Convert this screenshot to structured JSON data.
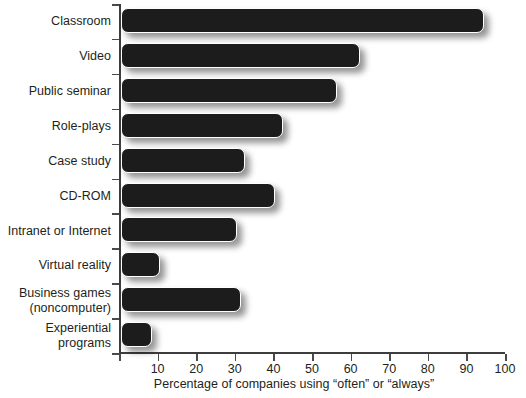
{
  "chart_data": {
    "type": "bar",
    "orientation": "horizontal",
    "title": "",
    "subtitle": "",
    "xlabel": "Percentage of companies using “often” or “always”",
    "ylabel": "",
    "xlim": [
      0,
      100
    ],
    "xticks": [
      0,
      10,
      20,
      30,
      40,
      50,
      60,
      70,
      80,
      90,
      100
    ],
    "xtick_labels": [
      "",
      "10",
      "20",
      "30",
      "40",
      "50",
      "60",
      "70",
      "80",
      "90",
      "100"
    ],
    "grid": false,
    "legend": null,
    "bar_color": "#1c1c1c",
    "bar_outline_color": "#ffffff",
    "axis_color": "#3d3d3d",
    "background_color": "#ffffff",
    "categories": [
      "Classroom",
      "Video",
      "Public seminar",
      "Role-plays",
      "Case study",
      "CD-ROM",
      "Intranet or Internet",
      "Virtual reality",
      "Business games (noncomputer)",
      "Experiential programs"
    ],
    "category_lines": [
      [
        "Classroom"
      ],
      [
        "Video"
      ],
      [
        "Public seminar"
      ],
      [
        "Role-plays"
      ],
      [
        "Case study"
      ],
      [
        "CD-ROM"
      ],
      [
        "Intranet or Internet"
      ],
      [
        "Virtual reality"
      ],
      [
        "Business games",
        "(noncomputer)"
      ],
      [
        "Experiential",
        "programs"
      ]
    ],
    "values": [
      94,
      62,
      56,
      42,
      32,
      40,
      30,
      10,
      31,
      8
    ]
  }
}
